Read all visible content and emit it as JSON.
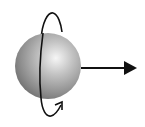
{
  "diagram": {
    "elements": [
      {
        "name": "sphere",
        "kind": "shaded-ball"
      },
      {
        "name": "rotation-loop",
        "kind": "curved-arrow",
        "direction": "around vertical axis"
      },
      {
        "name": "motion-arrow",
        "kind": "straight-arrow",
        "direction": "right"
      }
    ],
    "colors": {
      "sphere_highlight": "#f4f4f4",
      "sphere_mid": "#a8a8a8",
      "sphere_edge": "#6a6a6a",
      "stroke": "#111111",
      "background": "#ffffff"
    }
  }
}
